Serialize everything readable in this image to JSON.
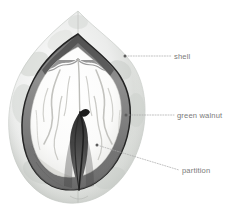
{
  "figure": {
    "background_color": "#ffffff",
    "width": 238,
    "height": 219,
    "label_color": "#7a7a7a",
    "leader_color": "#a8a8a8",
    "dot_color": "#5d5d5d"
  },
  "callouts": [
    {
      "id": "shell",
      "label": "shell",
      "anchor_x": 125,
      "anchor_y": 56,
      "line_end_x": 171,
      "line_end_y": 56,
      "text_x": 174,
      "text_y": 59
    },
    {
      "id": "green-walnut",
      "label": "green walnut",
      "anchor_x": 126,
      "anchor_y": 115,
      "line_end_x": 174,
      "line_end_y": 115,
      "text_x": 177,
      "text_y": 118
    },
    {
      "id": "partition",
      "label": "partition",
      "anchor_x": 97,
      "anchor_y": 145,
      "line_end_x": 179,
      "line_end_y": 170,
      "text_x": 182,
      "text_y": 173
    }
  ],
  "parts": {
    "shell_outer": "pale grey-green husk wall",
    "shell_inner": "dark inner shell lining",
    "kernel": "white walnut kernel halves",
    "partition": "dark central dividing wedge"
  }
}
